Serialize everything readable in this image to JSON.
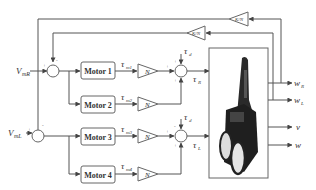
{
  "diagram": {
    "type": "block-diagram",
    "inputs": [
      {
        "id": "vmR",
        "main": "V",
        "sub": "mR"
      },
      {
        "id": "vmL",
        "main": "V",
        "sub": "mL"
      }
    ],
    "motors": [
      {
        "label": "Motor 1",
        "torque_main": "τ",
        "torque_sub": "m1"
      },
      {
        "label": "Motor 2",
        "torque_main": "τ",
        "torque_sub": "m2"
      },
      {
        "label": "Motor 3",
        "torque_main": "τ",
        "torque_sub": "m3"
      },
      {
        "label": "Motor 4",
        "torque_main": "τ",
        "torque_sub": "m4"
      }
    ],
    "gain_label": "N",
    "feedback_gains": [
      "K/N",
      "K/N"
    ],
    "disturbance": {
      "main": "τ",
      "sub": "d"
    },
    "summed_torques": [
      {
        "main": "τ",
        "sub": "R"
      },
      {
        "main": "τ",
        "sub": "L"
      }
    ],
    "outputs": [
      {
        "main": "w",
        "sub": "R"
      },
      {
        "main": "w",
        "sub": "L"
      },
      {
        "main": "v",
        "sub": ""
      },
      {
        "main": "w",
        "sub": ""
      }
    ],
    "signs": {
      "plus": "+",
      "minus": "-"
    }
  }
}
